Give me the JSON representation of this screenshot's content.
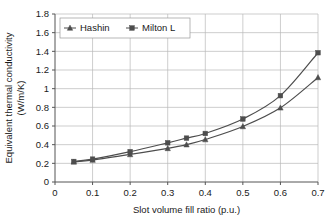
{
  "chart_data": {
    "type": "line",
    "title": "",
    "xlabel": "Slot volume fill ratio (p.u.)",
    "ylabel_line1": "Equivalent thermal conductivity",
    "ylabel_line2": "(W/m/K)",
    "xlim": [
      0,
      0.7
    ],
    "ylim": [
      0,
      1.8
    ],
    "xticks": [
      "0",
      "0.1",
      "0.2",
      "0.3",
      "0.4",
      "0.5",
      "0.6",
      "0.7"
    ],
    "xtick_values": [
      0,
      0.1,
      0.2,
      0.3,
      0.4,
      0.5,
      0.6,
      0.7
    ],
    "yticks": [
      "0",
      "0.2",
      "0.4",
      "0.6",
      "0.8",
      "1",
      "1.2",
      "1.4",
      "1.6",
      "1.8"
    ],
    "ytick_values": [
      0,
      0.2,
      0.4,
      0.6,
      0.8,
      1.0,
      1.2,
      1.4,
      1.6,
      1.8
    ],
    "grid": true,
    "grid_color": "#b8b8b8",
    "legend_position": "top-left",
    "x": [
      0.05,
      0.1,
      0.2,
      0.3,
      0.35,
      0.4,
      0.5,
      0.6,
      0.7
    ],
    "series": [
      {
        "name": "Hashin",
        "marker": "triangle",
        "color": "#4d4d4d",
        "values": [
          0.215,
          0.235,
          0.295,
          0.36,
          0.4,
          0.455,
          0.595,
          0.795,
          1.12
        ]
      },
      {
        "name": "Milton L",
        "marker": "square",
        "color": "#4d4d4d",
        "values": [
          0.22,
          0.245,
          0.325,
          0.42,
          0.47,
          0.52,
          0.675,
          0.925,
          1.385
        ]
      }
    ]
  },
  "legend": {
    "entries": [
      {
        "label": "Hashin"
      },
      {
        "label": "Milton L"
      }
    ]
  },
  "axes": {
    "x_title": "Slot volume fill ratio (p.u.)",
    "y_title_line1": "Equivalent thermal conductivity",
    "y_title_line2": "(W/m/K)"
  }
}
